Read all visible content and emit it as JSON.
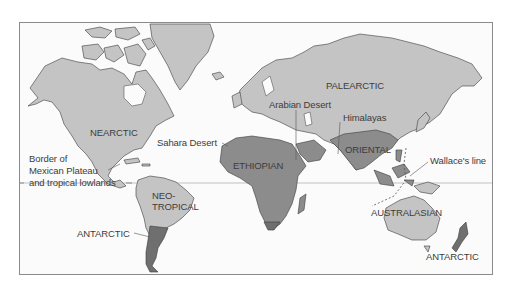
{
  "map": {
    "title": "Biogeographic realms of the world",
    "colors": {
      "land": "#c4c4c4",
      "tropical_realm": "#8c8c8c",
      "antarctic_realm": "#6f6f6f",
      "ocean": "#fbfbfb",
      "border": "#8a8a8a",
      "label_text": "#3c3c3c"
    },
    "realm_labels": {
      "nearctic": "NEARCTIC",
      "palearctic": "PALEARCTIC",
      "ethiopian": "ETHIOPIAN",
      "oriental": "ORIENTAL",
      "neotropical_1": "NEO-",
      "neotropical_2": "TROPICAL",
      "australasian": "AUSTRALASIAN",
      "antarctic_sa": "ANTARCTIC",
      "antarctic_nz": "ANTARCTIC"
    },
    "feature_labels": {
      "arabian_desert": "Arabian Desert",
      "himalayas": "Himalayas",
      "sahara_desert": "Sahara Desert",
      "wallace_line": "Wallace's line",
      "mexican_border_1": "Border of",
      "mexican_border_2": "Mexican Plateau",
      "mexican_border_3": "and tropical lowlands"
    }
  }
}
